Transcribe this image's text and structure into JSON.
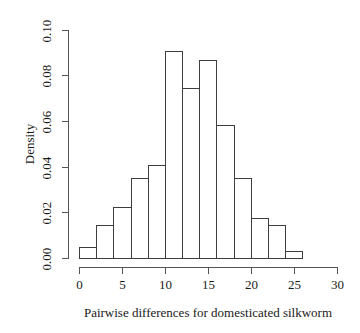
{
  "chart_data": {
    "type": "bar",
    "subtype": "histogram",
    "title": "",
    "xlabel": "Pairwise differences for domesticated silkworm",
    "ylabel": "Density",
    "xlim": [
      0,
      30
    ],
    "ylim": [
      0,
      0.1
    ],
    "grid": false,
    "legend": "none",
    "bin_width": 2,
    "bin_edges": [
      0,
      2,
      4,
      6,
      8,
      10,
      12,
      14,
      16,
      18,
      20,
      22,
      24,
      26
    ],
    "densities": [
      0.005,
      0.0145,
      0.0225,
      0.035,
      0.0405,
      0.0905,
      0.0745,
      0.0865,
      0.058,
      0.035,
      0.0175,
      0.0145,
      0.003
    ],
    "x_ticks": [
      0,
      5,
      10,
      15,
      20,
      25,
      30
    ],
    "x_tick_labels": [
      "0",
      "5",
      "10",
      "15",
      "20",
      "25",
      "30"
    ],
    "y_ticks": [
      0,
      0.02,
      0.04,
      0.06,
      0.08,
      0.1
    ],
    "y_tick_labels": [
      "0.00",
      "0.02",
      "0.04",
      "0.06",
      "0.08",
      "0.10"
    ],
    "colors": {
      "bar_fill": "#ffffff",
      "bar_border": "#3d3d3d",
      "axis": "#555555",
      "text": "#1a1a1a",
      "background": "#ffffff"
    }
  }
}
